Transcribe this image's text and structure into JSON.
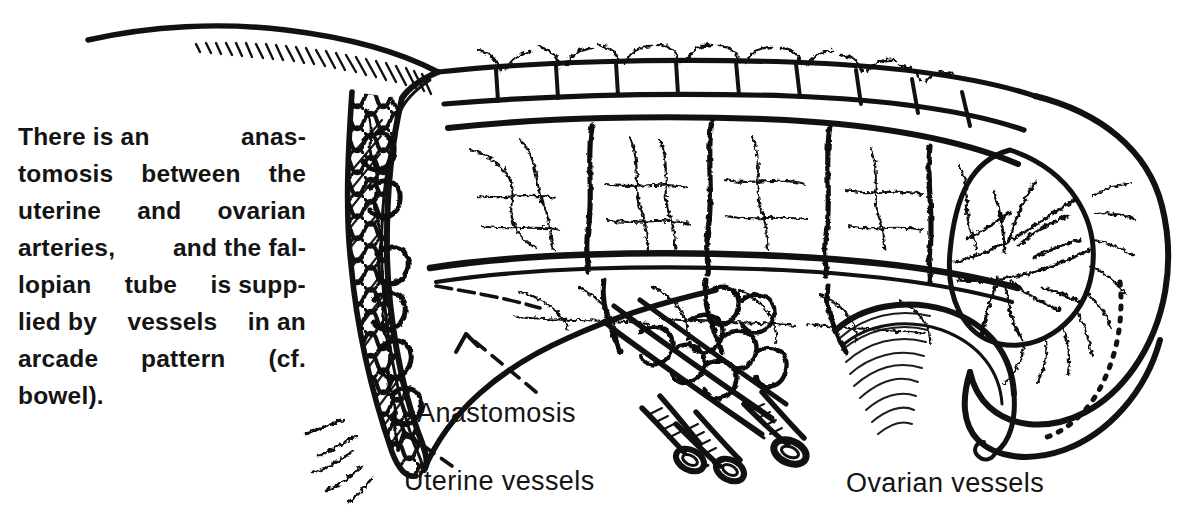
{
  "figure": {
    "kind": "anatomical-line-drawing",
    "ink_color": "#111111",
    "background_color": "#ffffff"
  },
  "caption": {
    "lines": [
      "    There is an anas-",
      "tomosis between the",
      "uterine and ovarian",
      "arteries, and the fal-",
      "lopian tube is supp-",
      "lied by vessels in an",
      "arcade pattern (cf.",
      "bowel)."
    ],
    "justified_lines": [
      [
        "There is an",
        "anas-"
      ],
      [
        "tomosis",
        "between",
        "the"
      ],
      [
        "uterine",
        "and",
        "ovarian"
      ],
      [
        "arteries,",
        "and the fal-"
      ],
      [
        "lopian",
        "tube",
        "is supp-"
      ],
      [
        "lied by",
        "vessels",
        "in an"
      ],
      [
        "arcade",
        "pattern",
        "(cf."
      ],
      [
        "bowel)."
      ]
    ],
    "full_text": "There is an anastomosis between the uterine and ovarian arteries, and the fallopian tube is supplied by vessels in an arcade pattern (cf. bowel)."
  },
  "labels": {
    "anastomosis": "Anastomosis",
    "uterine_vessels": "Uterine vessels",
    "ovarian_vessels": "Ovarian vessels"
  },
  "leaders": [
    {
      "label": "Anastomosis",
      "style": "dashed-with-arrowhead",
      "points": "from label up-left to vessel junction"
    },
    {
      "label": "Uterine vessels",
      "style": "dashed-with-arrowhead",
      "points": "from label up-left to coiled uterine vessels"
    }
  ],
  "parts": [
    "fallopian tube with vascular arcade",
    "mesosalpinx",
    "broad ligament",
    "uterine wall with coiled vessels",
    "ovary with radiating vessels",
    "cut ovarian vessel stumps",
    "mesovarium fold"
  ]
}
